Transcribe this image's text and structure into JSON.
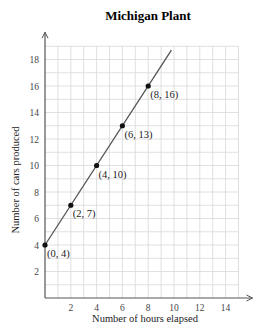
{
  "chart_data": {
    "type": "line",
    "title": "Michigan Plant",
    "xlabel": "Number of hours elapsed",
    "ylabel": "Number of cars produced",
    "xlim": [
      0,
      15
    ],
    "ylim": [
      0,
      19
    ],
    "grid": true,
    "x_ticks": [
      2,
      4,
      6,
      8,
      10,
      12,
      14
    ],
    "y_ticks": [
      2,
      4,
      6,
      8,
      10,
      12,
      14,
      16,
      18
    ],
    "series": [
      {
        "name": "Michigan Plant",
        "x": [
          0,
          2,
          4,
          6,
          8
        ],
        "y": [
          4,
          7,
          10,
          13,
          16
        ],
        "line_extends_to": [
          9.8,
          18.7
        ]
      }
    ],
    "annotations": [
      "(0, 4)",
      "(2, 7)",
      "(4, 10)",
      "(6, 13)",
      "(8, 16)"
    ]
  },
  "colors": {
    "line": "#555555",
    "grid": "#d8d8d8",
    "axis": "#555555",
    "point": "#111111"
  }
}
